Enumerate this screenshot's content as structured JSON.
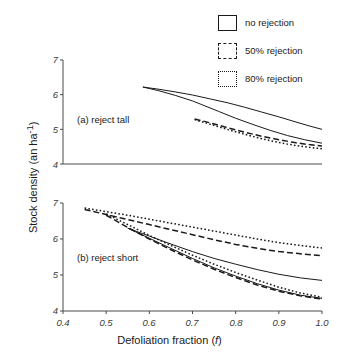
{
  "figure": {
    "yaxis_title": "Stock density (an ha",
    "yaxis_title_sup": "-1",
    "yaxis_title_end": ")",
    "xaxis_title": "Defoliation fraction (",
    "xaxis_title_italic": "f",
    "xaxis_title_end": ")"
  },
  "legend": {
    "position": "top-right",
    "items": [
      {
        "label": "no rejection",
        "style": "solid",
        "swatch": "solid-box-swatch"
      },
      {
        "label": "50% rejection",
        "style": "dashed",
        "swatch": "dashed-box-swatch"
      },
      {
        "label": "80% rejection",
        "style": "dotted",
        "swatch": "dotted-box-swatch"
      }
    ]
  },
  "panels": [
    {
      "key": "a",
      "label": "(a) reject tall"
    },
    {
      "key": "b",
      "label": "(b) reject short"
    }
  ],
  "axes": {
    "y_ticks": [
      "7",
      "6",
      "5",
      "4"
    ],
    "y_tick_values": [
      7,
      6,
      5,
      4
    ],
    "x_ticks": [
      "0.4",
      "0.5",
      "0.6",
      "0.7",
      "0.8",
      "0.9",
      "1.0"
    ],
    "x_tick_values": [
      0.4,
      0.5,
      0.6,
      0.7,
      0.8,
      0.9,
      1.0
    ]
  },
  "chart_data": {
    "type": "line",
    "title": "",
    "xlabel": "Defoliation fraction (f)",
    "ylabel": "Stock density (an ha-1)",
    "xlim": [
      0.4,
      1.0
    ],
    "ylim": [
      4,
      7
    ],
    "grid": false,
    "legend_position": "top-right",
    "panels": [
      {
        "key": "a",
        "label": "(a) reject tall",
        "series": [
          {
            "name": "no rejection",
            "style": "solid",
            "x": [
              0.585,
              0.62,
              0.66,
              0.7,
              0.74,
              0.78,
              0.82,
              0.86,
              0.9,
              0.94,
              0.97,
              1.0
            ],
            "y": [
              6.22,
              6.16,
              6.08,
              5.99,
              5.88,
              5.77,
              5.64,
              5.5,
              5.36,
              5.21,
              5.1,
              5.0
            ]
          },
          {
            "name": "no rejection (lower branch)",
            "style": "solid",
            "x": [
              0.585,
              0.62,
              0.66,
              0.7,
              0.72,
              0.76,
              0.8,
              0.84,
              0.88,
              0.92,
              0.96,
              1.0
            ],
            "y": [
              6.22,
              6.12,
              5.98,
              5.82,
              5.72,
              5.52,
              5.32,
              5.14,
              4.97,
              4.82,
              4.7,
              4.6
            ]
          },
          {
            "name": "50% rejection",
            "style": "dashed",
            "x": [
              0.705,
              0.74,
              0.78,
              0.82,
              0.86,
              0.9,
              0.94,
              0.97,
              1.0
            ],
            "y": [
              5.3,
              5.19,
              5.05,
              4.92,
              4.8,
              4.7,
              4.61,
              4.56,
              4.52
            ]
          },
          {
            "name": "80% rejection",
            "style": "dotted",
            "x": [
              0.705,
              0.74,
              0.78,
              0.82,
              0.86,
              0.9,
              0.94,
              0.97,
              1.0
            ],
            "y": [
              5.28,
              5.15,
              5.0,
              4.86,
              4.73,
              4.62,
              4.53,
              4.48,
              4.44
            ]
          }
        ]
      },
      {
        "key": "b",
        "label": "(b) reject short",
        "series": [
          {
            "name": "80% rejection",
            "style": "dotted",
            "x": [
              0.45,
              0.5,
              0.55,
              0.6,
              0.65,
              0.7,
              0.75,
              0.8,
              0.85,
              0.9,
              0.95,
              1.0
            ],
            "y": [
              6.86,
              6.76,
              6.66,
              6.55,
              6.44,
              6.33,
              6.22,
              6.11,
              6.0,
              5.9,
              5.82,
              5.75
            ]
          },
          {
            "name": "50% rejection",
            "style": "dashed",
            "x": [
              0.45,
              0.5,
              0.55,
              0.6,
              0.65,
              0.7,
              0.75,
              0.8,
              0.85,
              0.9,
              0.95,
              1.0
            ],
            "y": [
              6.82,
              6.68,
              6.54,
              6.4,
              6.26,
              6.12,
              5.98,
              5.85,
              5.74,
              5.65,
              5.59,
              5.54
            ]
          },
          {
            "name": "no rejection",
            "style": "solid",
            "x": [
              0.55,
              0.6,
              0.65,
              0.7,
              0.75,
              0.8,
              0.85,
              0.9,
              0.95,
              1.0
            ],
            "y": [
              6.3,
              6.08,
              5.86,
              5.65,
              5.46,
              5.3,
              5.15,
              5.02,
              4.92,
              4.85
            ]
          },
          {
            "name": "no rejection (lower branch)",
            "style": "solid",
            "x": [
              0.55,
              0.6,
              0.65,
              0.7,
              0.75,
              0.8,
              0.85,
              0.9,
              0.95,
              1.0
            ],
            "y": [
              6.3,
              6.02,
              5.74,
              5.46,
              5.2,
              4.97,
              4.76,
              4.58,
              4.44,
              4.35
            ]
          },
          {
            "name": "50% rejection (lower branch)",
            "style": "dashed",
            "x": [
              0.5,
              0.55,
              0.6,
              0.65,
              0.7,
              0.75,
              0.8,
              0.85,
              0.9,
              0.95,
              1.0
            ],
            "y": [
              6.66,
              6.32,
              6.0,
              5.7,
              5.42,
              5.16,
              4.93,
              4.72,
              4.55,
              4.42,
              4.33
            ]
          },
          {
            "name": "80% rejection (lower branch)",
            "style": "dotted",
            "x": [
              0.5,
              0.55,
              0.6,
              0.65,
              0.7,
              0.75,
              0.8,
              0.85,
              0.9,
              0.95,
              1.0
            ],
            "y": [
              6.7,
              6.4,
              6.1,
              5.82,
              5.55,
              5.3,
              5.07,
              4.86,
              4.66,
              4.5,
              4.38
            ]
          }
        ]
      }
    ]
  }
}
